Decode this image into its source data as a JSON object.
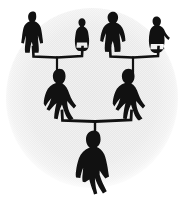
{
  "figure": {
    "caption": "Three-generation pedigree of black human silhouettes inside a pale gray circle",
    "type": "diagram",
    "width": 185,
    "height": 200
  },
  "colors": {
    "background": "#ffffff",
    "circle_fill": "#e9e9e9",
    "circle_fill_edge": "#f2f2f2",
    "silhouette": "#111111",
    "connector": "#111111"
  },
  "circle": {
    "name": "background-circle",
    "cx": 92,
    "cy": 98,
    "rx": 86,
    "ry": 90,
    "label": "pale gray circular backdrop"
  },
  "generations": [
    {
      "id": "generation-1",
      "label": "Grandparents",
      "row": 1,
      "people": [
        {
          "id": "g1-p1",
          "label": "Grandfather (left pair)",
          "pose": "standing, arms out, coat",
          "x": 33,
          "y": 33,
          "scale": 1.0
        },
        {
          "id": "g1-p2",
          "label": "Grandmother (left pair)",
          "pose": "standing, narrow, skirt",
          "x": 82,
          "y": 35,
          "scale": 0.78
        },
        {
          "id": "g1-p3",
          "label": "Grandfather (right pair)",
          "pose": "standing, broad, cloak",
          "x": 113,
          "y": 33,
          "scale": 0.98
        },
        {
          "id": "g1-p4",
          "label": "Grandmother (right pair)",
          "pose": "standing, dress, arm out",
          "x": 157,
          "y": 35,
          "scale": 0.86
        }
      ]
    },
    {
      "id": "generation-2",
      "label": "Parents",
      "row": 2,
      "people": [
        {
          "id": "g2-p1",
          "label": "Mother",
          "pose": "seated / wide coat",
          "x": 60,
          "y": 95,
          "scale": 1.22
        },
        {
          "id": "g2-p2",
          "label": "Father",
          "pose": "seated / wide coat",
          "x": 129,
          "y": 95,
          "scale": 1.22
        }
      ]
    },
    {
      "id": "generation-3",
      "label": "Child",
      "row": 3,
      "people": [
        {
          "id": "g3-p1",
          "label": "Child",
          "pose": "standing, legs apart, arms down",
          "x": 94,
          "y": 162,
          "scale": 1.45
        }
      ]
    }
  ],
  "connectors": [
    {
      "id": "connector-left-couple",
      "label": "Bracket joining left grandparent pair down to the mother",
      "left_x": 33,
      "right_x": 82,
      "bar_y": 56,
      "drop_x": 57,
      "drop_to_y": 72
    },
    {
      "id": "connector-right-couple",
      "label": "Bracket joining right grandparent pair down to the father",
      "left_x": 110,
      "right_x": 158,
      "bar_y": 56,
      "drop_x": 133,
      "drop_to_y": 72
    },
    {
      "id": "connector-parents",
      "label": "Bracket joining the two parents down to the child",
      "left_x": 62,
      "right_x": 131,
      "bar_y": 120,
      "drop_x": 95,
      "drop_to_y": 139
    }
  ],
  "accessibility": {
    "alt_text": "A family tree drawn as solid black human silhouettes on a pale gray circle: four grandparents on the top row, two parents on the middle row, and one child at the bottom, joined by hand-drawn bracket lines."
  }
}
